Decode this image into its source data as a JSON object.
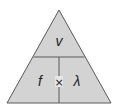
{
  "diagram": {
    "type": "formula-triangle",
    "top": {
      "label": "v"
    },
    "bottom_left": {
      "label": "f"
    },
    "operator": {
      "label": "×"
    },
    "bottom_right": {
      "label": "λ"
    },
    "colors": {
      "fill": "#d3d3d3",
      "stroke": "#5a5a5a",
      "text": "#222222"
    }
  }
}
